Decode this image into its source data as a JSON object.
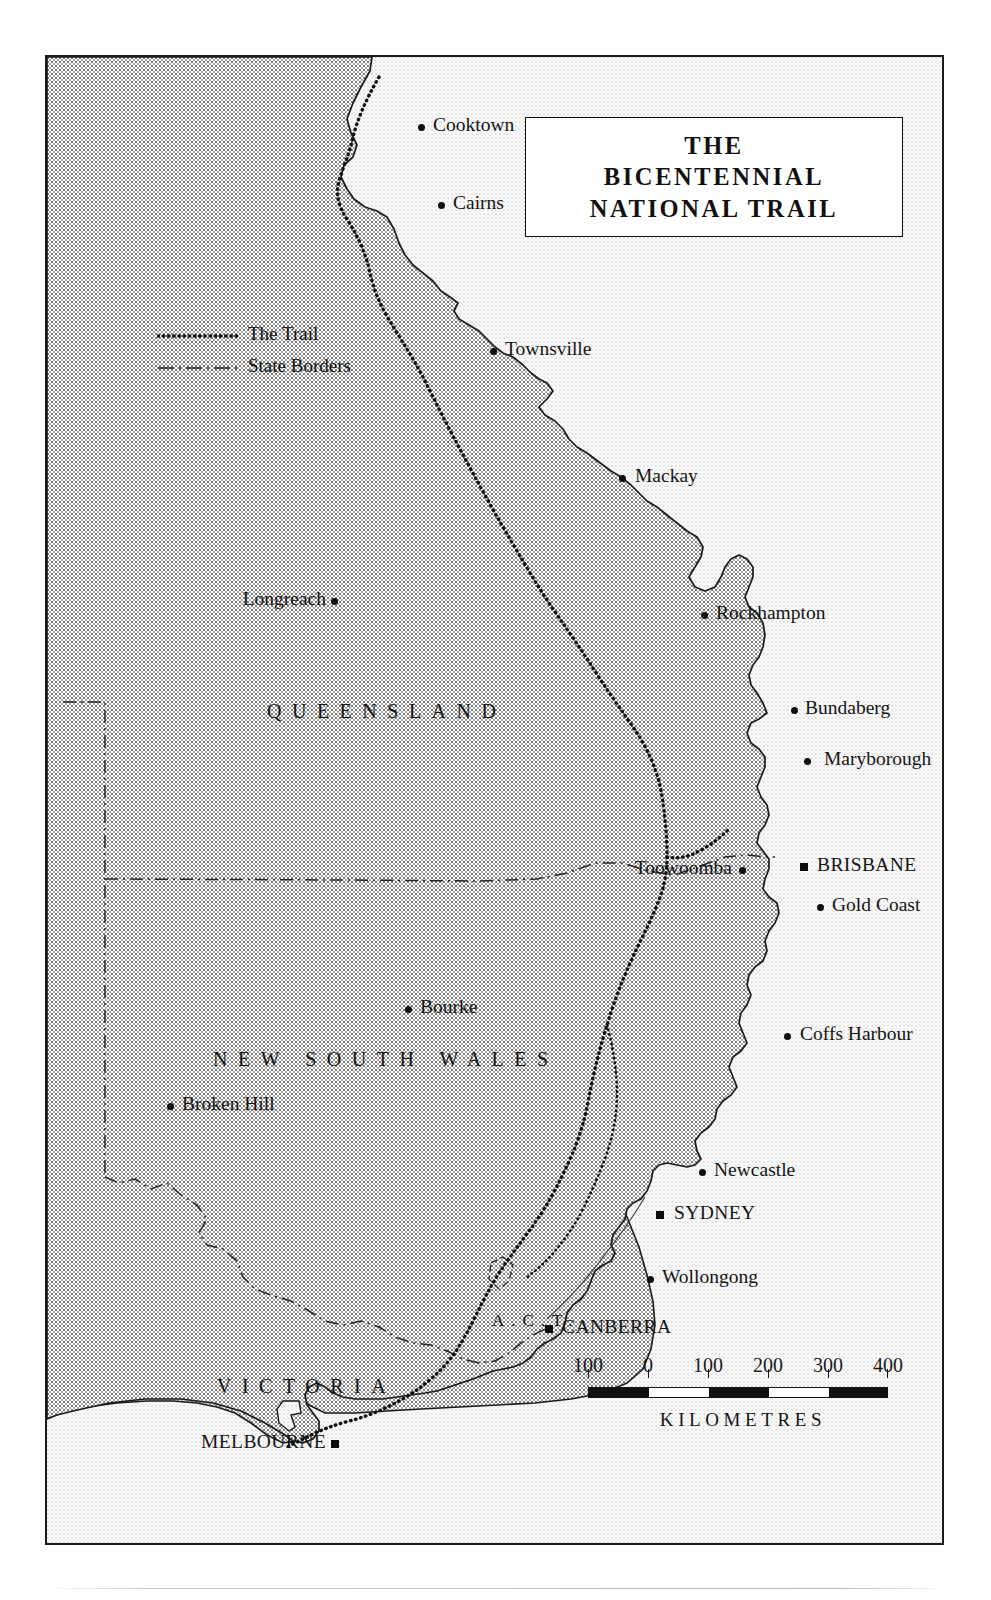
{
  "title": {
    "line1": "THE",
    "line2": "BICENTENNIAL",
    "line3": "NATIONAL TRAIL"
  },
  "legend": {
    "items": [
      {
        "key": "dotted-line",
        "label": "The Trail"
      },
      {
        "key": "dash-dot-line",
        "label": "State Borders"
      }
    ]
  },
  "states": [
    {
      "name": "QUEENSLAND",
      "x": 222,
      "y": 645
    },
    {
      "name": "NEW SOUTH WALES",
      "x": 168,
      "y": 993
    },
    {
      "name": "VICTORIA",
      "x": 172,
      "y": 1320
    }
  ],
  "territory": {
    "name": "A.C.T.",
    "x": 447,
    "y": 1256
  },
  "cities": [
    {
      "name": "Cooktown",
      "type": "city",
      "dot_x": 376,
      "dot_y": 72,
      "label_x": 388,
      "label_y": 59,
      "anchor": "left"
    },
    {
      "name": "Cairns",
      "type": "city",
      "dot_x": 396,
      "dot_y": 150,
      "label_x": 408,
      "label_y": 137,
      "anchor": "left"
    },
    {
      "name": "Townsville",
      "type": "city",
      "dot_x": 448,
      "dot_y": 296,
      "label_x": 460,
      "label_y": 283,
      "anchor": "left"
    },
    {
      "name": "Mackay",
      "type": "city",
      "dot_x": 577,
      "dot_y": 423,
      "label_x": 590,
      "label_y": 410,
      "anchor": "left"
    },
    {
      "name": "Longreach",
      "type": "city",
      "dot_x": 289,
      "dot_y": 546,
      "label_x": 281,
      "label_y": 533,
      "anchor": "right"
    },
    {
      "name": "Rockhampton",
      "type": "city",
      "dot_x": 659,
      "dot_y": 560,
      "label_x": 671,
      "label_y": 547,
      "anchor": "left"
    },
    {
      "name": "Bundaberg",
      "type": "city",
      "dot_x": 749,
      "dot_y": 655,
      "label_x": 760,
      "label_y": 642,
      "anchor": "left"
    },
    {
      "name": "Maryborough",
      "type": "city",
      "dot_x": 762,
      "dot_y": 706,
      "label_x": 779,
      "label_y": 693,
      "anchor": "left"
    },
    {
      "name": "Toowoomba",
      "type": "city",
      "dot_x": 697,
      "dot_y": 815,
      "label_x": 687,
      "label_y": 802,
      "anchor": "right"
    },
    {
      "name": "BRISBANE",
      "type": "capital",
      "dot_x": 759,
      "dot_y": 812,
      "label_x": 772,
      "label_y": 799,
      "anchor": "left"
    },
    {
      "name": "Gold Coast",
      "type": "city",
      "dot_x": 775,
      "dot_y": 852,
      "label_x": 787,
      "label_y": 839,
      "anchor": "left"
    },
    {
      "name": "Bourke",
      "type": "city",
      "dot_x": 363,
      "dot_y": 954,
      "label_x": 375,
      "label_y": 941,
      "anchor": "left"
    },
    {
      "name": "Coffs Harbour",
      "type": "city",
      "dot_x": 742,
      "dot_y": 981,
      "label_x": 755,
      "label_y": 968,
      "anchor": "left"
    },
    {
      "name": "Broken Hill",
      "type": "city",
      "dot_x": 125,
      "dot_y": 1051,
      "label_x": 137,
      "label_y": 1038,
      "anchor": "left"
    },
    {
      "name": "Newcastle",
      "type": "city",
      "dot_x": 657,
      "dot_y": 1117,
      "label_x": 669,
      "label_y": 1104,
      "anchor": "left"
    },
    {
      "name": "SYDNEY",
      "type": "capital",
      "dot_x": 615,
      "dot_y": 1160,
      "label_x": 629,
      "label_y": 1147,
      "anchor": "left"
    },
    {
      "name": "Wollongong",
      "type": "city",
      "dot_x": 605,
      "dot_y": 1224,
      "label_x": 617,
      "label_y": 1211,
      "anchor": "left"
    },
    {
      "name": "CANBERRA",
      "type": "capital",
      "dot_x": 504,
      "dot_y": 1274,
      "label_x": 517,
      "label_y": 1261,
      "anchor": "left"
    },
    {
      "name": "MELBOURNE",
      "type": "capital",
      "dot_x": 290,
      "dot_y": 1389,
      "label_x": 281,
      "label_y": 1376,
      "anchor": "right"
    }
  ],
  "scale": {
    "ticks": [
      "100",
      "0",
      "100",
      "200",
      "300",
      "400"
    ],
    "caption": "KILOMETRES",
    "segments": [
      "black",
      "white",
      "black",
      "white",
      "black"
    ]
  },
  "colors": {
    "ink": "#141414",
    "land": "#c8c8c8",
    "ocean": "#efefef",
    "paper": "#ffffff"
  }
}
